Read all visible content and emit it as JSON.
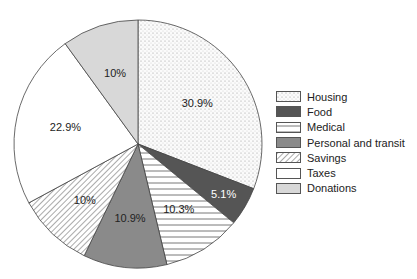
{
  "chart_data": {
    "type": "pie",
    "title": "",
    "categories": [
      "Housing",
      "Food",
      "Medical",
      "Personal and transit",
      "Savings",
      "Taxes",
      "Donations"
    ],
    "values": [
      30.9,
      5.1,
      10.3,
      10.9,
      10,
      22.9,
      10
    ],
    "labels": [
      "30.9%",
      "5.1%",
      "10.3%",
      "10.9%",
      "10%",
      "22.9%",
      "10%"
    ],
    "patterns": [
      "dotted",
      "dark-gray",
      "horizontal-lines",
      "mid-gray",
      "diagonal-hatch",
      "white",
      "light-gray"
    ],
    "colors": [
      "#f2f2f2",
      "#555555",
      "#ffffff",
      "#8a8a8a",
      "#ffffff",
      "#ffffff",
      "#d8d8d8"
    ],
    "legend_position": "right",
    "start_angle": "12 o'clock, clockwise"
  },
  "legend": {
    "items": [
      {
        "label": "Housing"
      },
      {
        "label": "Food"
      },
      {
        "label": "Medical"
      },
      {
        "label": "Personal and transit"
      },
      {
        "label": "Savings"
      },
      {
        "label": "Taxes"
      },
      {
        "label": "Donations"
      }
    ]
  }
}
